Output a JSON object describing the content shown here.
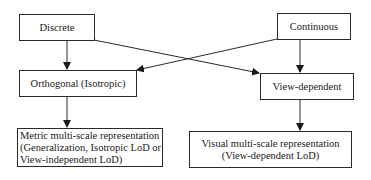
{
  "diagram": {
    "type": "flowchart",
    "nodes": {
      "discrete": {
        "label": "Discrete"
      },
      "continuous": {
        "label": "Continuous"
      },
      "orthogonal": {
        "label": "Orthogonal (Isotropic)"
      },
      "view_dependent": {
        "label": "View-dependent"
      },
      "metric": {
        "line1": "Metric multi-scale representation",
        "line2": "(Generalization, Isotropic LoD or",
        "line3": "View-independent LoD)"
      },
      "visual": {
        "line1": "Visual multi-scale representation",
        "line2": "(View-dependent LoD)"
      }
    },
    "edges": [
      {
        "from": "Discrete",
        "to": "Orthogonal (Isotropic)"
      },
      {
        "from": "Discrete",
        "to": "View-dependent"
      },
      {
        "from": "Continuous",
        "to": "View-dependent"
      },
      {
        "from": "Continuous",
        "to": "Orthogonal (Isotropic)"
      },
      {
        "from": "Orthogonal (Isotropic)",
        "to": "Metric multi-scale representation"
      },
      {
        "from": "View-dependent",
        "to": "Visual multi-scale representation"
      }
    ],
    "colors": {
      "line": "#2a2a2a",
      "background": "#ffffff",
      "text": "#1a1a1a"
    }
  }
}
